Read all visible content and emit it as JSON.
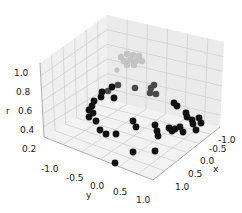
{
  "chart_data": {
    "type": "scatter3d",
    "title": "",
    "xlabel": "x",
    "ylabel": "y",
    "zlabel": "r",
    "xlim": [
      -1.25,
      1.25
    ],
    "ylim": [
      -1.25,
      1.25
    ],
    "zlim": [
      0.2,
      1.1
    ],
    "x_ticks": [
      "-1.0",
      "-0.5",
      "0.0",
      "0.5",
      "1.0"
    ],
    "y_ticks": [
      "-1.0",
      "-0.5",
      "0.0",
      "0.5",
      "1.0"
    ],
    "z_ticks": [
      "0.2",
      "0.4",
      "0.6",
      "0.8",
      "1.0"
    ],
    "grid": true,
    "legend": null,
    "colors": {
      "pane": "#f2f2f2",
      "pane_side": "#ebebeb",
      "grid": "#cfcfcf",
      "edge": "#8a8a8a",
      "points_dark": "#111111",
      "points_mid": "#4a4a4a",
      "points_light": "#c4c4c4"
    },
    "points_screen": [
      {
        "cx": 121,
        "cy": 57,
        "r": 3.2,
        "c": "light"
      },
      {
        "cx": 127,
        "cy": 54,
        "r": 3.2,
        "c": "light"
      },
      {
        "cx": 133,
        "cy": 55,
        "r": 3.2,
        "c": "light"
      },
      {
        "cx": 139,
        "cy": 56,
        "r": 3.2,
        "c": "light"
      },
      {
        "cx": 124,
        "cy": 61,
        "r": 3.2,
        "c": "light"
      },
      {
        "cx": 130,
        "cy": 60,
        "r": 3.2,
        "c": "light"
      },
      {
        "cx": 136,
        "cy": 61,
        "r": 3.2,
        "c": "light"
      },
      {
        "cx": 142,
        "cy": 61,
        "r": 3.2,
        "c": "light"
      },
      {
        "cx": 127,
        "cy": 65,
        "r": 3.2,
        "c": "light"
      },
      {
        "cx": 134,
        "cy": 65,
        "r": 3.2,
        "c": "light"
      },
      {
        "cx": 117,
        "cy": 70,
        "r": 2.6,
        "c": "light"
      },
      {
        "cx": 135,
        "cy": 88,
        "r": 3.3,
        "c": "mid"
      },
      {
        "cx": 151,
        "cy": 88,
        "r": 3.3,
        "c": "mid"
      },
      {
        "cx": 154,
        "cy": 85,
        "r": 3.3,
        "c": "mid"
      },
      {
        "cx": 150,
        "cy": 93,
        "r": 3.3,
        "c": "mid"
      },
      {
        "cx": 156,
        "cy": 94,
        "r": 3.3,
        "c": "mid"
      },
      {
        "cx": 118,
        "cy": 85,
        "r": 3.3,
        "c": "mid"
      },
      {
        "cx": 108,
        "cy": 91,
        "r": 3.3,
        "c": "mid"
      },
      {
        "cx": 102,
        "cy": 92,
        "r": 3.4,
        "c": "dark"
      },
      {
        "cx": 112,
        "cy": 87,
        "r": 3.4,
        "c": "dark"
      },
      {
        "cx": 101,
        "cy": 97,
        "r": 3.4,
        "c": "dark"
      },
      {
        "cx": 114,
        "cy": 98,
        "r": 3.4,
        "c": "dark"
      },
      {
        "cx": 94,
        "cy": 101,
        "r": 3.4,
        "c": "dark"
      },
      {
        "cx": 92,
        "cy": 106,
        "r": 3.4,
        "c": "dark"
      },
      {
        "cx": 89,
        "cy": 110,
        "r": 3.4,
        "c": "dark"
      },
      {
        "cx": 93,
        "cy": 113,
        "r": 3.4,
        "c": "dark"
      },
      {
        "cx": 89,
        "cy": 117,
        "r": 3.4,
        "c": "dark"
      },
      {
        "cx": 96,
        "cy": 121,
        "r": 3.4,
        "c": "dark"
      },
      {
        "cx": 100,
        "cy": 130,
        "r": 3.4,
        "c": "dark"
      },
      {
        "cx": 106,
        "cy": 134,
        "r": 3.4,
        "c": "dark"
      },
      {
        "cx": 116,
        "cy": 134,
        "r": 3.4,
        "c": "dark"
      },
      {
        "cx": 133,
        "cy": 121,
        "r": 3.4,
        "c": "dark"
      },
      {
        "cx": 136,
        "cy": 127,
        "r": 3.4,
        "c": "dark"
      },
      {
        "cx": 133,
        "cy": 152,
        "r": 3.4,
        "c": "dark"
      },
      {
        "cx": 115,
        "cy": 163,
        "r": 3.4,
        "c": "dark"
      },
      {
        "cx": 157,
        "cy": 131,
        "r": 3.4,
        "c": "dark"
      },
      {
        "cx": 155,
        "cy": 125,
        "r": 3.4,
        "c": "dark"
      },
      {
        "cx": 158,
        "cy": 136,
        "r": 3.4,
        "c": "dark"
      },
      {
        "cx": 169,
        "cy": 128,
        "r": 3.4,
        "c": "dark"
      },
      {
        "cx": 172,
        "cy": 131,
        "r": 3.4,
        "c": "dark"
      },
      {
        "cx": 175,
        "cy": 129,
        "r": 3.4,
        "c": "dark"
      },
      {
        "cx": 180,
        "cy": 127,
        "r": 3.4,
        "c": "dark"
      },
      {
        "cx": 183,
        "cy": 132,
        "r": 3.4,
        "c": "dark"
      },
      {
        "cx": 155,
        "cy": 151,
        "r": 3.4,
        "c": "dark"
      },
      {
        "cx": 174,
        "cy": 103,
        "r": 3.4,
        "c": "dark"
      },
      {
        "cx": 177,
        "cy": 106,
        "r": 3.4,
        "c": "dark"
      },
      {
        "cx": 186,
        "cy": 113,
        "r": 3.4,
        "c": "dark"
      },
      {
        "cx": 187,
        "cy": 117,
        "r": 3.4,
        "c": "dark"
      },
      {
        "cx": 192,
        "cy": 120,
        "r": 3.4,
        "c": "dark"
      },
      {
        "cx": 193,
        "cy": 124,
        "r": 3.4,
        "c": "dark"
      },
      {
        "cx": 199,
        "cy": 118,
        "r": 3.4,
        "c": "dark"
      },
      {
        "cx": 196,
        "cy": 130,
        "r": 3.4,
        "c": "dark"
      },
      {
        "cx": 201,
        "cy": 123,
        "r": 3.4,
        "c": "dark"
      }
    ]
  }
}
